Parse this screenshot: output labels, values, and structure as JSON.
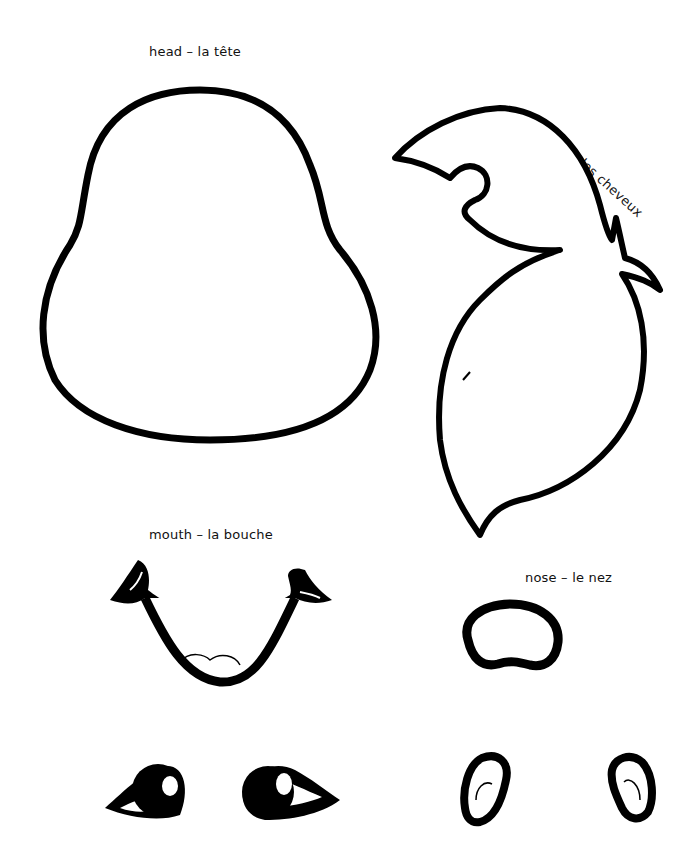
{
  "sheet": {
    "background": "#ffffff",
    "ink": "#000000",
    "pieces": [
      {
        "id": "head",
        "label": "head – la tête"
      },
      {
        "id": "hair",
        "label": "hair – les cheveux"
      },
      {
        "id": "mouth",
        "label": "mouth – la bouche"
      },
      {
        "id": "nose",
        "label": "nose – le nez"
      },
      {
        "id": "eyes",
        "label": ""
      },
      {
        "id": "ears",
        "label": ""
      }
    ]
  }
}
